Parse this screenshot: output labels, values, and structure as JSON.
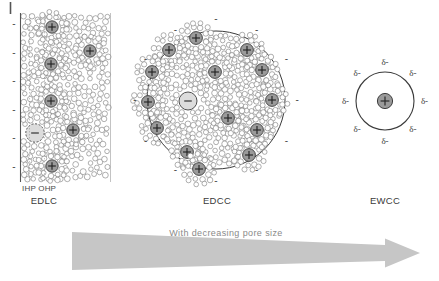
{
  "figure": {
    "title_visible": false,
    "background": "#ffffff"
  },
  "panels": [
    {
      "id": "edlc",
      "label": "EDLC",
      "sublabels": [
        "IHP",
        "OHP"
      ],
      "sublabel_combined": "IHP OHP",
      "type": "planar-electrode",
      "electrode_charge_symbol": "-",
      "electrode_charge_count": 6,
      "ion_symbol": "+",
      "anion_symbol": "-",
      "description_visible": false
    },
    {
      "id": "edcc",
      "label": "EDCC",
      "type": "circular-pore",
      "outer_charge_symbol": "-",
      "outer_charge_count": 12,
      "ion_symbol": "+",
      "anion_symbol": "-",
      "cation_count": 13,
      "anion_count": 1
    },
    {
      "id": "ewcc",
      "label": "EWCC",
      "type": "single-ion-wire",
      "ion_symbol": "+",
      "delta_symbol": "δ-",
      "delta_count": 8
    }
  ],
  "arrow": {
    "caption": "With decreasing pore size",
    "color": "#c6c6c6",
    "direction": "right"
  },
  "colors": {
    "ion_fill": "#9a9a9a",
    "ion_stroke": "#3d3d3d",
    "anion_fill": "#dcdcdc",
    "solvent_stroke": "#6e6e6e",
    "outline": "#3a3a3a",
    "text": "#3a3a3a",
    "arrow": "#c6c6c6"
  }
}
